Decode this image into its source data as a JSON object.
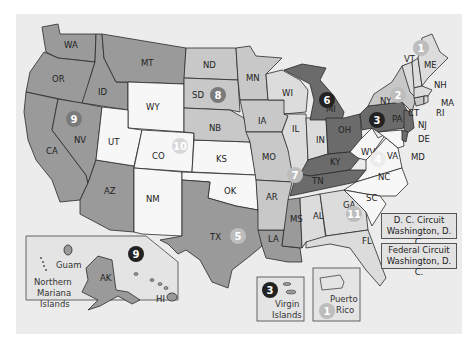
{
  "map": {
    "title": "U.S. Courts of Appeals Circuit Map",
    "colors": {
      "background": "#ececec",
      "dark": "#6b6b6b",
      "medium": "#9a9a9a",
      "light": "#c8c8c8",
      "white": "#f7f7f7",
      "badge_dark": "#222222",
      "badge_medium": "#7a7a7a",
      "badge_light": "#bdbdbd"
    },
    "states": {
      "WA": "WA",
      "OR": "OR",
      "CA": "CA",
      "ID": "ID",
      "NV": "NV",
      "MT": "MT",
      "AZ": "AZ",
      "WY": "WY",
      "UT": "UT",
      "CO": "CO",
      "NM": "NM",
      "ND": "ND",
      "SD": "SD",
      "NB": "NB",
      "KS": "KS",
      "OK": "OK",
      "TX": "TX",
      "MN": "MN",
      "IA": "IA",
      "MO": "MO",
      "AR": "AR",
      "LA": "LA",
      "WI": "WI",
      "IL": "IL",
      "IN": "IN",
      "MI": "MI",
      "OH": "OH",
      "KY": "KY",
      "TN": "TN",
      "MS": "MS",
      "AL": "AL",
      "GA": "GA",
      "FL": "FL",
      "SC": "SC",
      "NC": "NC",
      "VA": "VA",
      "WV": "WV",
      "MD": "MD",
      "DE": "DE",
      "NJ": "NJ",
      "PA": "PA",
      "NY": "NY",
      "CT": "CT",
      "RI": "RI",
      "MA": "MA",
      "NH": "NH",
      "VT": "VT",
      "ME": "ME",
      "AK": "AK",
      "HI": "HI"
    },
    "circuits": [
      {
        "number": "1",
        "x": 421,
        "y": 48,
        "style": "light"
      },
      {
        "number": "2",
        "x": 398,
        "y": 95,
        "style": "light"
      },
      {
        "number": "3",
        "x": 377,
        "y": 120,
        "style": "dark"
      },
      {
        "number": "4",
        "x": 378,
        "y": 159,
        "style": "white"
      },
      {
        "number": "5",
        "x": 238,
        "y": 236,
        "style": "light"
      },
      {
        "number": "6",
        "x": 327,
        "y": 100,
        "style": "dark"
      },
      {
        "number": "7",
        "x": 295,
        "y": 175,
        "style": "light"
      },
      {
        "number": "8",
        "x": 218,
        "y": 95,
        "style": "medium"
      },
      {
        "number": "9",
        "x": 74,
        "y": 119,
        "style": "medium"
      },
      {
        "number": "10",
        "x": 180,
        "y": 146,
        "style": "light"
      },
      {
        "number": "11",
        "x": 354,
        "y": 214,
        "style": "light"
      }
    ],
    "insets": {
      "pacific": {
        "circuit": "9",
        "guam": "Guam",
        "cnmi": [
          "Northern",
          "Mariana",
          "Islands"
        ],
        "ak": "AK",
        "hi": "HI"
      },
      "virgin_islands": {
        "circuit": "3",
        "label": [
          "Virgin",
          "Islands"
        ]
      },
      "puerto_rico": {
        "circuit": "1",
        "label": [
          "Puerto",
          "Rico"
        ]
      }
    },
    "legend_boxes": [
      {
        "line1": "D. C. Circuit",
        "line2": "Washington, D. C."
      },
      {
        "line1": "Federal Circuit",
        "line2": "Washington, D. C."
      }
    ]
  }
}
